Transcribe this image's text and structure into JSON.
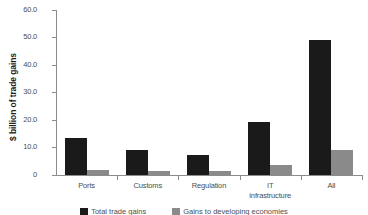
{
  "chart_data": {
    "type": "bar",
    "title": "",
    "xlabel": "",
    "ylabel": "$ billion of trade gains",
    "ylim": [
      0,
      60
    ],
    "yticks": [
      "0",
      "10.0",
      "20.0",
      "30.0",
      "40.0",
      "50.0",
      "60.0"
    ],
    "ytick_values": [
      0,
      10,
      20,
      30,
      40,
      50,
      60
    ],
    "grid": false,
    "legend_position": "bottom",
    "categories": [
      "Ports",
      "Customs",
      "Regulation",
      "IT infrastructure",
      "All"
    ],
    "category_lines": [
      [
        "Ports"
      ],
      [
        "Customs"
      ],
      [
        "Regulation"
      ],
      [
        "IT",
        "infrastructure"
      ],
      [
        "All"
      ]
    ],
    "series": [
      {
        "name": "Total trade gains",
        "color": "#1a1a1a",
        "values": [
          13.3,
          9.2,
          7.3,
          19.2,
          49.2
        ]
      },
      {
        "name": "Gains to developing economies",
        "color": "#8a8a8a",
        "values": [
          2.0,
          1.5,
          1.6,
          3.5,
          9.0
        ]
      }
    ]
  },
  "colors": {
    "series_dark": "#1a1a1a",
    "series_light": "#8a8a8a",
    "axis": "#8c8c8c",
    "tick_text": "#4d4d4d",
    "background": "#ffffff"
  }
}
